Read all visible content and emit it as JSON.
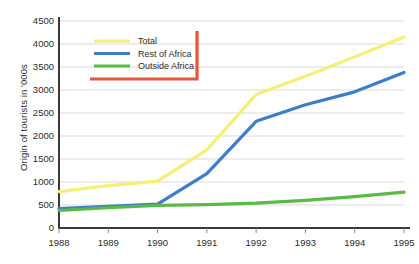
{
  "chart_data": {
    "type": "line",
    "title": "",
    "xlabel": "",
    "ylabel": "Origin of tourists in '000s",
    "categories": [
      "1988",
      "1989",
      "1990",
      "1991",
      "1992",
      "1993",
      "1994",
      "1995"
    ],
    "x": [
      1988,
      1989,
      1990,
      1991,
      1992,
      1993,
      1994,
      1995
    ],
    "xlim": [
      1988,
      1995
    ],
    "ylim": [
      0,
      4500
    ],
    "ytick_labels": [
      "0",
      "500",
      "1000",
      "1500",
      "2000",
      "2500",
      "3000",
      "3500",
      "4000",
      "4500"
    ],
    "ytick_values": [
      0,
      500,
      1000,
      1500,
      2000,
      2500,
      3000,
      3500,
      4000,
      4500
    ],
    "grid": true,
    "grid_axis": "y",
    "legend_position": "top-left",
    "series": [
      {
        "name": "Total",
        "color": "#F5EF73",
        "values": [
          790,
          920,
          1020,
          1700,
          2900,
          3300,
          3720,
          4150
        ]
      },
      {
        "name": "Rest of Africa",
        "color": "#3D7EC8",
        "values": [
          420,
          470,
          520,
          1180,
          2320,
          2680,
          2960,
          3380
        ]
      },
      {
        "name": "Outside Africa",
        "color": "#5BB947",
        "values": [
          380,
          440,
          490,
          510,
          540,
          600,
          680,
          780
        ]
      }
    ]
  },
  "legend": {
    "items": [
      {
        "label": "Total",
        "color": "#F5EF73"
      },
      {
        "label": "Rest of Africa",
        "color": "#3D7EC8"
      },
      {
        "label": "Outside Africa",
        "color": "#5BB947"
      }
    ],
    "accent_border_color": "#E8543C"
  },
  "colors": {
    "axis": "#3a3a3a",
    "gridline": "#d9d9d9",
    "text": "#2b2b2b",
    "background": "#ffffff"
  }
}
